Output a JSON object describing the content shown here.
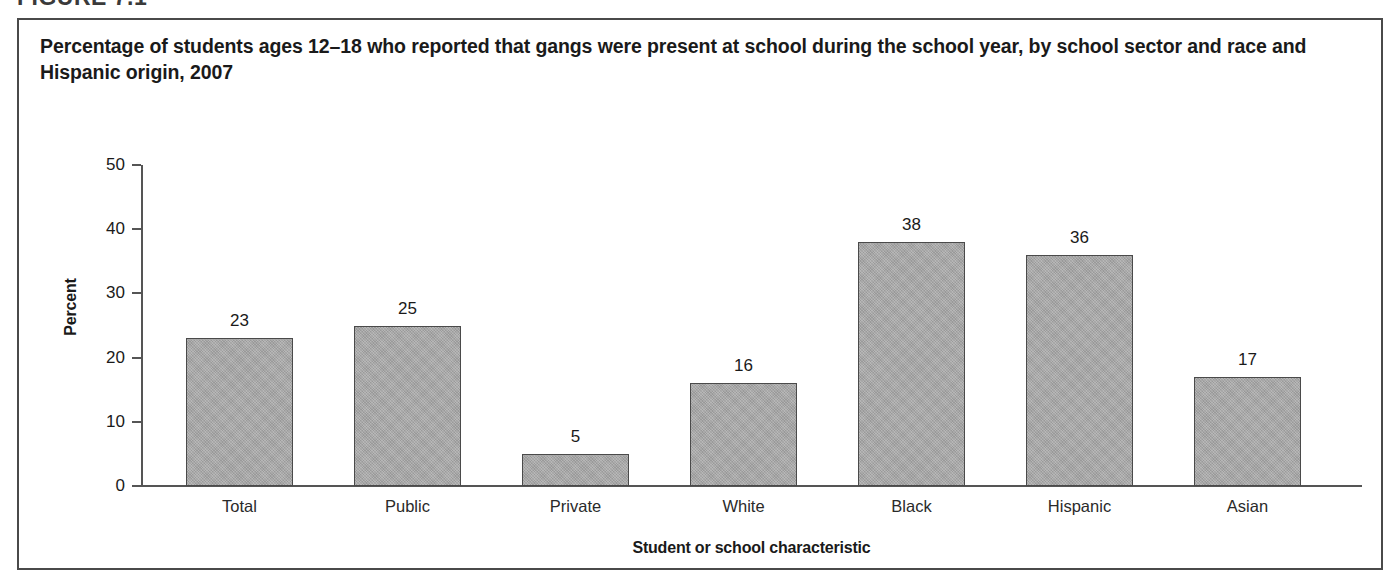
{
  "figure_header": "FIGURE 7.1",
  "title": "Percentage of students ages 12–18 who reported that gangs were present at school during the school year, by school sector and race and Hispanic origin, 2007",
  "chart_data": {
    "type": "bar",
    "title": "Percentage of students ages 12–18 who reported that gangs were present at school during the school year, by school sector and race and Hispanic origin, 2007",
    "xlabel": "Student or school characteristic",
    "ylabel": "Percent",
    "categories": [
      "Total",
      "Public",
      "Private",
      "White",
      "Black",
      "Hispanic",
      "Asian"
    ],
    "values": [
      23,
      25,
      5,
      16,
      38,
      36,
      17
    ],
    "value_labels": [
      "23",
      "25",
      "5",
      "16",
      "38",
      "36",
      "17"
    ],
    "ylim": [
      0,
      50
    ],
    "yticks": [
      0,
      10,
      20,
      30,
      40,
      50
    ],
    "ytick_labels": [
      "0",
      "10",
      "20",
      "30",
      "40",
      "50"
    ],
    "grid": false,
    "legend": false,
    "bar_color": "#a8a8a8",
    "bar_edge_color": "#4a4a4a",
    "axis_color": "#555555",
    "text_color": "#1a1a1a"
  }
}
